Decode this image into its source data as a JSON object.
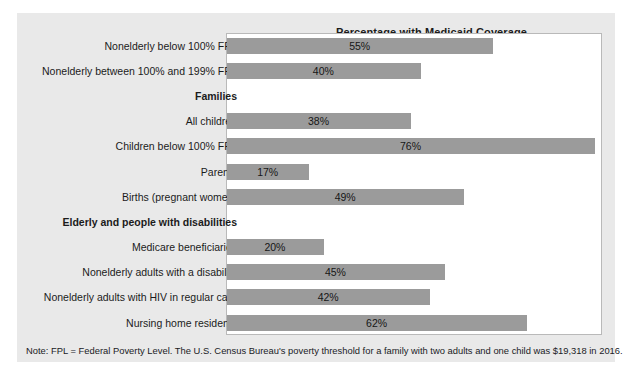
{
  "chart_data": {
    "type": "bar",
    "orientation": "horizontal",
    "title": "Percentage with Medicaid Coverage",
    "xlabel": "",
    "ylabel": "",
    "xlim": [
      0,
      76
    ],
    "grid": false,
    "legend": "none",
    "bar_color": "#9b9b9b",
    "plot_background": "#ffffff",
    "card_background": "#e9e9e9",
    "categories": [
      "Nonelderly below 100% FPL",
      "Nonelderly between 100% and 199% FPL",
      "Families",
      "All children",
      "Children below 100% FPL",
      "Parents",
      "Births (pregnant women)",
      "Elderly and people with disabilities",
      "Medicare beneficiaries",
      "Nonelderly adults with a disability",
      "Nonelderly adults with HIV in regular care",
      "Nursing home residents"
    ],
    "values": [
      55,
      40,
      null,
      38,
      76,
      17,
      49,
      null,
      20,
      45,
      42,
      62
    ],
    "value_labels": [
      "55%",
      "40%",
      "",
      "38%",
      "76%",
      "17%",
      "49%",
      "",
      "20%",
      "45%",
      "42%",
      "62%"
    ],
    "section_headers": [
      "Families",
      "Elderly and people with disabilities"
    ]
  },
  "chart": {
    "title": "Percentage with Medicaid Coverage",
    "rows": [
      {
        "label": "Nonelderly below 100% FPL",
        "value": 55,
        "value_label": "55%",
        "is_section": false
      },
      {
        "label": "Nonelderly between 100% and 199% FPL",
        "value": 40,
        "value_label": "40%",
        "is_section": false
      },
      {
        "label": "Families",
        "value": null,
        "value_label": "",
        "is_section": true
      },
      {
        "label": "All children",
        "value": 38,
        "value_label": "38%",
        "is_section": false
      },
      {
        "label": "Children below 100% FPL",
        "value": 76,
        "value_label": "76%",
        "is_section": false
      },
      {
        "label": "Parents",
        "value": 17,
        "value_label": "17%",
        "is_section": false
      },
      {
        "label": "Births (pregnant women)",
        "value": 49,
        "value_label": "49%",
        "is_section": false
      },
      {
        "label": "Elderly and people with disabilities",
        "value": null,
        "value_label": "",
        "is_section": true
      },
      {
        "label": "Medicare beneficiaries",
        "value": 20,
        "value_label": "20%",
        "is_section": false
      },
      {
        "label": "Nonelderly adults with a disability",
        "value": 45,
        "value_label": "45%",
        "is_section": false
      },
      {
        "label": "Nonelderly adults with HIV in regular care",
        "value": 42,
        "value_label": "42%",
        "is_section": false
      },
      {
        "label": "Nursing home residents",
        "value": 62,
        "value_label": "62%",
        "is_section": false
      }
    ]
  },
  "note": {
    "text": "Note: FPL = Federal Poverty Level. The U.S. Census Bureau's poverty threshold for a family with two adults and one child was $19,318 in 2016."
  }
}
